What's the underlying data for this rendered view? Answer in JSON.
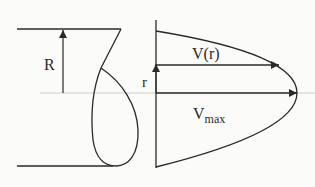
{
  "diagram": {
    "labels": {
      "radius": "R",
      "radial_coordinate": "r",
      "velocity_at_r": "V(r)",
      "max_velocity_base": "V",
      "max_velocity_sub": "max"
    },
    "colors": {
      "stroke": "#2a2a2a",
      "centerline": "#c8c8c8",
      "background": "#fbfbfa"
    }
  }
}
